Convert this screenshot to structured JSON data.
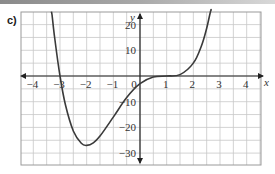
{
  "part_label": "c)",
  "chart_data": {
    "type": "line",
    "title": "",
    "xlabel": "x",
    "ylabel": "y",
    "xlim": [
      -4.5,
      4.5
    ],
    "ylim": [
      -35,
      25
    ],
    "grid": true,
    "x_ticks": [
      -4,
      -3,
      -2,
      -1,
      0,
      1,
      2,
      3,
      4
    ],
    "x_tick_labels": [
      "−4",
      "−3",
      "−2",
      "−1",
      "0",
      "1",
      "2",
      "3",
      "4"
    ],
    "y_ticks": [
      20,
      10,
      -10,
      -20,
      -30
    ],
    "y_tick_labels": [
      "20",
      "10",
      "−10",
      "−20",
      "−30"
    ],
    "series": [
      {
        "name": "f(x) = (x+3)(x−1)^3",
        "x": [
          -3.3,
          -3.2,
          -3,
          -2.8,
          -2.5,
          -2.2,
          -2,
          -1.75,
          -1.5,
          -1,
          -0.5,
          0,
          0.5,
          1,
          1.5,
          2,
          2.3,
          2.5,
          2.65
        ],
        "y": [
          23.9,
          14.8,
          0,
          -11,
          -21.4,
          -26.2,
          -27,
          -26,
          -23.4,
          -16,
          -8.4,
          -3,
          -0.44,
          0,
          0.56,
          5,
          11.6,
          18.6,
          25.4
        ]
      }
    ],
    "features": {
      "x_intercepts": [
        -3,
        1
      ],
      "y_intercept": -3,
      "local_minimum": {
        "x": -2,
        "y": -27
      },
      "stationary_inflection": {
        "x": 1,
        "y": 0
      }
    },
    "colors": {
      "curve": "#3a3a3a",
      "grid": "#c8c8c8",
      "axes": "#222222"
    }
  }
}
